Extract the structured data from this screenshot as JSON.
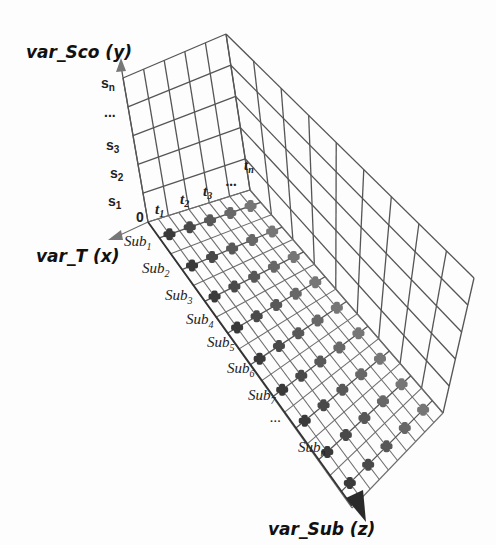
{
  "diagram": {
    "type": "3d-grid",
    "axes": {
      "y": {
        "title": "var_Sco (y)",
        "ticks": [
          "0",
          "s1",
          "s2",
          "s3",
          "...",
          "sn"
        ]
      },
      "x": {
        "title": "var_T (x)",
        "ticks": [
          "t1",
          "t2",
          "t3",
          "...",
          "tn"
        ]
      },
      "z": {
        "title": "var_Sub (z)",
        "ticks": [
          "Sub1",
          "Sub2",
          "Sub3",
          "Sub4",
          "Sub5",
          "Sub6",
          "Sub7",
          "...",
          "Subn"
        ]
      }
    },
    "origin_label": "0",
    "colors": {
      "grid": "#555555",
      "marker_near": "#3a3a3a",
      "marker_far": "#767676",
      "arrow": "#2a2a2a",
      "arrow_light": "#777777"
    }
  }
}
